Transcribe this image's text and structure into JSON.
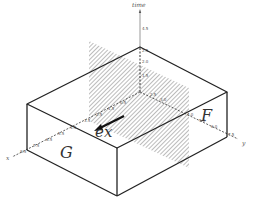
{
  "diagram": {
    "type": "3d-box-with-plane",
    "axes": {
      "time": {
        "label": "time",
        "ticks": [
          "1.5",
          "2.0",
          "2.5",
          "4.5"
        ]
      },
      "y": {
        "label": "y",
        "ticks": [
          "2.5",
          "3.0",
          "4.0",
          "5.0",
          "6.0",
          "7.5"
        ]
      },
      "x": {
        "label": "x",
        "ticks": [
          "0.5",
          "1.5",
          "2.5",
          "3.5",
          "4.5",
          "5.5",
          "6.5",
          "7.5",
          "8.5"
        ]
      }
    },
    "faces": {
      "front_left": "G",
      "right": "F"
    },
    "vector": {
      "label": "ex"
    },
    "colors": {
      "line": "#222222",
      "hatch": "#888888",
      "axis": "#444444"
    }
  }
}
